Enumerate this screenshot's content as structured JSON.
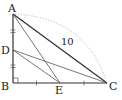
{
  "diagram": {
    "type": "geometry",
    "colors": {
      "line": "#333333",
      "dotted_arc": "#999999",
      "text": "#222222"
    },
    "points": {
      "A": {
        "label": "A",
        "x": 13,
        "y": 14
      },
      "B": {
        "label": "B",
        "x": 13,
        "y": 83
      },
      "C": {
        "label": "C",
        "x": 107,
        "y": 83
      },
      "D": {
        "label": "D",
        "x": 13,
        "y": 50
      },
      "E": {
        "label": "E",
        "x": 60,
        "y": 83
      }
    },
    "segments": [
      "AB",
      "BC",
      "AC",
      "AE",
      "DE",
      "DC"
    ],
    "annotations": {
      "ac_length": "10",
      "right_angle_at": "B",
      "equal_marks": [
        "AD = DB",
        "BE = EC"
      ]
    }
  }
}
